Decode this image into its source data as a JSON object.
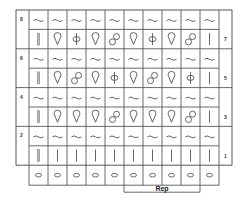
{
  "diagram": {
    "type": "knitting-chart",
    "columns": 10,
    "colors": {
      "grid": "#444444",
      "symbol": "#555555",
      "background": "#ffffff"
    },
    "left_row_labels": [
      "8",
      "6",
      "4",
      "2"
    ],
    "right_row_labels": [
      "7",
      "5",
      "3",
      "1"
    ],
    "rows": [
      {
        "row": 8,
        "side": "left",
        "cells": [
          "wave",
          "wave",
          "wave",
          "wave",
          "wave",
          "wave",
          "wave",
          "wave",
          "wave",
          "wave"
        ]
      },
      {
        "row": 7,
        "side": "right",
        "cells": [
          "double-bar",
          "teardrop",
          "phi",
          "teardrop",
          "figure-eight",
          "teardrop",
          "phi",
          "teardrop",
          "figure-eight",
          "bar"
        ]
      },
      {
        "row": 6,
        "side": "left",
        "cells": [
          "wave",
          "wave",
          "wave",
          "wave",
          "wave",
          "wave",
          "wave",
          "wave",
          "wave",
          "wave"
        ]
      },
      {
        "row": 5,
        "side": "right",
        "cells": [
          "double-bar",
          "teardrop",
          "figure-eight",
          "teardrop",
          "phi",
          "teardrop",
          "figure-eight",
          "teardrop",
          "phi",
          "bar"
        ]
      },
      {
        "row": 4,
        "side": "left",
        "cells": [
          "wave",
          "wave",
          "wave",
          "wave",
          "wave",
          "wave",
          "wave",
          "wave",
          "wave",
          "wave"
        ]
      },
      {
        "row": 3,
        "side": "right",
        "cells": [
          "double-bar",
          "teardrop",
          "teardrop",
          "teardrop",
          "figure-eight",
          "teardrop",
          "teardrop",
          "teardrop",
          "figure-eight",
          "bar"
        ]
      },
      {
        "row": 2,
        "side": "left",
        "cells": [
          "wave",
          "wave",
          "wave",
          "wave",
          "wave",
          "wave",
          "wave",
          "wave",
          "wave",
          "wave"
        ]
      },
      {
        "row": 1,
        "side": "right",
        "cells": [
          "double-bar",
          "bar",
          "bar",
          "bar",
          "bar",
          "bar",
          "bar",
          "bar",
          "bar",
          "bar"
        ]
      }
    ],
    "foundation_row": [
      "oval",
      "oval",
      "oval",
      "oval",
      "oval",
      "oval",
      "oval",
      "oval",
      "oval",
      "oval"
    ],
    "repeat": {
      "label": "Rep",
      "start_column": 6,
      "end_column": 9
    }
  }
}
